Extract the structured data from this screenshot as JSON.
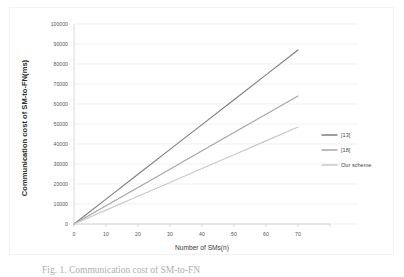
{
  "figure": {
    "caption": "Fig. 1. Communication cost of SM-to-FN"
  },
  "chart_data": {
    "type": "line",
    "title": "",
    "xlabel": "Number of SMs(n)",
    "ylabel": "Communication cost of SM-to-FN(ms)",
    "x": [
      0,
      10,
      20,
      30,
      40,
      50,
      60,
      70
    ],
    "xlim": [
      0,
      80
    ],
    "ylim": [
      0,
      100000
    ],
    "xticks": [
      "0",
      "10",
      "20",
      "30",
      "40",
      "50",
      "60",
      "70"
    ],
    "yticks": [
      "0",
      "10000",
      "20000",
      "30000",
      "40000",
      "50000",
      "60000",
      "70000",
      "80000",
      "90000",
      "100000"
    ],
    "grid": true,
    "legend_position": "right",
    "series": [
      {
        "name": "[13]",
        "color": "#7f7f7f",
        "values": [
          0,
          12430,
          24860,
          37290,
          49710,
          62140,
          74570,
          87000
        ]
      },
      {
        "name": "[18]",
        "color": "#a6a6a6",
        "values": [
          0,
          9140,
          18290,
          27430,
          36570,
          45710,
          54860,
          64000
        ]
      },
      {
        "name": "Our scheme",
        "color": "#c9c9c9",
        "values": [
          0,
          6930,
          13860,
          20790,
          27710,
          34640,
          41570,
          48500
        ]
      }
    ]
  },
  "legend": {
    "items": [
      {
        "label": "[13]"
      },
      {
        "label": "[18]"
      },
      {
        "label": "Our scheme"
      }
    ]
  },
  "axes": {
    "x_title": "Number of SMs(n)",
    "y_title": "Communication cost of SM-to-FN(ms)"
  }
}
